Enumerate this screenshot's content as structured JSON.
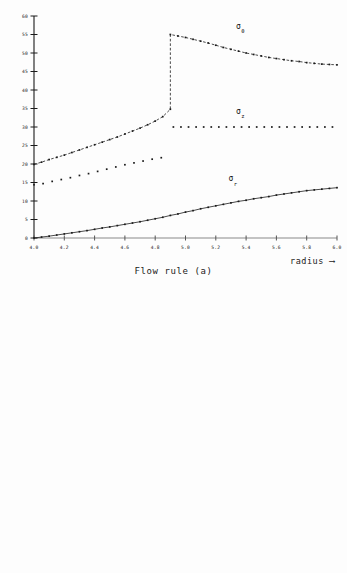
{
  "figures": [
    {
      "id": "flow-rule-a",
      "caption": "Flow rule (a)",
      "xaxis_label": "radius ⟶",
      "chart_data": {
        "type": "scatter",
        "title": "Flow rule (a)",
        "xlabel": "radius ⟶",
        "ylabel": "",
        "xlim": [
          4.0,
          6.0
        ],
        "ylim": [
          0,
          60
        ],
        "xticks": [
          4.0,
          4.2,
          4.4,
          4.6,
          4.8,
          5.0,
          5.2,
          5.4,
          5.6,
          5.8,
          6.0
        ],
        "xtick_labels": [
          "4.0",
          "4.2",
          "4.4",
          "4.6",
          "4.8",
          "5.0",
          "5.2",
          "5.4",
          "5.6",
          "5.8",
          "6.0"
        ],
        "yticks": [
          0,
          5,
          10,
          15,
          20,
          25,
          30,
          35,
          40,
          45,
          50,
          55,
          60
        ],
        "ytick_labels": [
          "0",
          "5",
          "10",
          "15",
          "20",
          "25",
          "30",
          "35",
          "40",
          "45",
          "50",
          "55",
          "60"
        ],
        "grid": false,
        "legend": "inline-annotations",
        "discontinuity_x": 4.9,
        "series": [
          {
            "name": "sigma_theta",
            "label_base": "σ",
            "label_sub": "θ",
            "label_x": 5.35,
            "label_y": 56.5,
            "style": "dashed-with-markers",
            "x": [
              4.0,
              4.05,
              4.1,
              4.15,
              4.2,
              4.25,
              4.3,
              4.35,
              4.4,
              4.45,
              4.5,
              4.55,
              4.6,
              4.65,
              4.7,
              4.75,
              4.8,
              4.85,
              4.9,
              4.9,
              4.95,
              5.0,
              5.05,
              5.1,
              5.15,
              5.2,
              5.25,
              5.3,
              5.35,
              5.4,
              5.45,
              5.5,
              5.55,
              5.6,
              5.65,
              5.7,
              5.75,
              5.8,
              5.85,
              5.9,
              5.95,
              6.0
            ],
            "y": [
              19.9,
              20.5,
              21.2,
              21.8,
              22.4,
              23.1,
              23.8,
              24.5,
              25.2,
              25.9,
              26.6,
              27.3,
              28.1,
              28.9,
              29.7,
              30.6,
              31.6,
              32.8,
              34.8,
              55.0,
              54.6,
              54.2,
              53.7,
              53.2,
              52.7,
              52.1,
              51.5,
              51.0,
              50.5,
              50.0,
              49.6,
              49.2,
              48.8,
              48.5,
              48.2,
              47.9,
              47.7,
              47.4,
              47.2,
              47.0,
              46.9,
              46.8
            ]
          },
          {
            "name": "sigma_z",
            "label_base": "σ",
            "label_sub": "z",
            "label_x": 5.35,
            "label_y": 33.6,
            "style": "dotted-markers",
            "x": [
              4.92,
              4.97,
              5.02,
              5.07,
              5.12,
              5.17,
              5.22,
              5.27,
              5.32,
              5.37,
              5.42,
              5.47,
              5.52,
              5.57,
              5.62,
              5.67,
              5.72,
              5.77,
              5.82,
              5.87,
              5.92,
              5.97
            ],
            "y": [
              30.0,
              30.0,
              30.0,
              30.0,
              30.0,
              30.0,
              30.0,
              30.0,
              30.0,
              30.0,
              30.0,
              30.0,
              30.0,
              30.0,
              30.0,
              30.0,
              30.0,
              30.0,
              30.0,
              30.0,
              30.0,
              30.0
            ]
          },
          {
            "name": "sigma_z_inner",
            "label_base": "",
            "label_sub": "",
            "style": "dotted-markers",
            "x": [
              4.0,
              4.06,
              4.12,
              4.18,
              4.24,
              4.3,
              4.36,
              4.42,
              4.48,
              4.54,
              4.6,
              4.66,
              4.72,
              4.78,
              4.84
            ],
            "y": [
              14.4,
              14.7,
              15.3,
              15.8,
              16.3,
              16.9,
              17.4,
              18.0,
              18.6,
              19.2,
              19.8,
              20.3,
              20.8,
              21.3,
              21.7
            ]
          },
          {
            "name": "sigma_r",
            "label_base": "σ",
            "label_sub": "r",
            "label_x": 5.3,
            "label_y": 15.3,
            "style": "solid-with-markers",
            "x": [
              4.0,
              4.05,
              4.1,
              4.15,
              4.2,
              4.25,
              4.3,
              4.35,
              4.4,
              4.45,
              4.5,
              4.55,
              4.6,
              4.65,
              4.7,
              4.75,
              4.8,
              4.85,
              4.9,
              4.95,
              5.0,
              5.05,
              5.1,
              5.15,
              5.2,
              5.25,
              5.3,
              5.35,
              5.4,
              5.45,
              5.5,
              5.55,
              5.6,
              5.65,
              5.7,
              5.75,
              5.8,
              5.85,
              5.9,
              5.95,
              6.0
            ],
            "y": [
              0.0,
              0.25,
              0.5,
              0.8,
              1.1,
              1.4,
              1.7,
              2.0,
              2.35,
              2.7,
              3.0,
              3.35,
              3.7,
              4.05,
              4.4,
              4.8,
              5.2,
              5.6,
              6.1,
              6.5,
              7.0,
              7.4,
              7.9,
              8.3,
              8.7,
              9.1,
              9.5,
              9.9,
              10.2,
              10.6,
              10.9,
              11.2,
              11.6,
              11.9,
              12.2,
              12.5,
              12.8,
              13.0,
              13.2,
              13.4,
              13.6
            ]
          }
        ]
      }
    },
    {
      "id": "flow-rule-b",
      "caption": "Flow rule (b)",
      "xaxis_label": "radius ⟶",
      "chart_data": {
        "type": "scatter",
        "title": "Flow rule (b)",
        "xlabel": "radius ⟶",
        "ylabel": "",
        "xlim": [
          4.0,
          6.0
        ],
        "ylim": [
          0,
          60
        ],
        "xticks": [
          4.0,
          4.2,
          4.4,
          4.6,
          4.8,
          5.0,
          5.2,
          5.4,
          5.6,
          5.8,
          6.0
        ],
        "xtick_labels": [
          "4.0",
          "4.2",
          "4.4",
          "4.6",
          "4.8",
          "5.0",
          "5.2",
          "5.4",
          "5.6",
          "5.8",
          "6.0"
        ],
        "yticks": [
          0,
          5,
          10,
          15,
          20,
          25,
          30,
          35,
          40,
          45,
          50,
          55,
          60
        ],
        "ytick_labels": [
          "0",
          "5",
          "10",
          "15",
          "20",
          "25",
          "30",
          "35",
          "40",
          "45",
          "50",
          "55",
          "60"
        ],
        "grid": false,
        "legend": "inline-annotations",
        "discontinuity_x": 4.9,
        "series": [
          {
            "name": "sigma_theta",
            "label_base": "σ",
            "label_sub": "θ",
            "label_x": 5.35,
            "label_y": 56.5,
            "style": "dashed-with-markers",
            "x": [
              4.0,
              4.05,
              4.1,
              4.15,
              4.2,
              4.25,
              4.3,
              4.35,
              4.4,
              4.45,
              4.5,
              4.55,
              4.6,
              4.65,
              4.7,
              4.75,
              4.8,
              4.85,
              4.9,
              4.9,
              4.95,
              5.0,
              5.05,
              5.1,
              5.15,
              5.2,
              5.25,
              5.3,
              5.35,
              5.4,
              5.45,
              5.5,
              5.55,
              5.6,
              5.65,
              5.7,
              5.75,
              5.8,
              5.85,
              5.9,
              5.95,
              6.0
            ],
            "y": [
              19.9,
              20.5,
              21.2,
              21.9,
              22.6,
              23.3,
              24.0,
              24.7,
              25.4,
              26.1,
              26.8,
              27.5,
              28.3,
              29.1,
              29.9,
              30.8,
              31.8,
              33.0,
              34.9,
              55.0,
              54.5,
              54.0,
              53.5,
              53.0,
              52.5,
              52.0,
              51.4,
              50.9,
              50.4,
              49.9,
              49.5,
              49.1,
              48.7,
              48.4,
              48.1,
              47.8,
              47.5,
              47.3,
              47.1,
              46.9,
              46.8,
              46.7
            ]
          },
          {
            "name": "sigma_z",
            "label_base": "σ",
            "label_sub": "z",
            "label_x": 5.35,
            "label_y": 33.6,
            "style": "dotted-markers",
            "x": [
              4.92,
              4.97,
              5.02,
              5.07,
              5.12,
              5.17,
              5.22,
              5.27,
              5.32,
              5.37,
              5.42,
              5.47,
              5.52,
              5.57,
              5.62,
              5.67,
              5.72,
              5.77,
              5.82,
              5.87,
              5.92,
              5.97
            ],
            "y": [
              30.0,
              30.0,
              30.0,
              30.0,
              30.0,
              30.0,
              30.0,
              30.0,
              30.0,
              30.0,
              30.0,
              30.0,
              30.0,
              30.0,
              30.0,
              30.0,
              30.0,
              30.0,
              30.0,
              30.0,
              30.0,
              30.0
            ]
          },
          {
            "name": "sigma_z_inner",
            "label_base": "",
            "label_sub": "",
            "style": "dotted-markers",
            "x": [
              4.0,
              4.06,
              4.12,
              4.18,
              4.24,
              4.3,
              4.36,
              4.42,
              4.48,
              4.54,
              4.6,
              4.66,
              4.72,
              4.78,
              4.84
            ],
            "y": [
              11.8,
              12.3,
              13.0,
              13.6,
              14.2,
              14.9,
              15.5,
              16.2,
              16.9,
              17.6,
              18.3,
              19.0,
              19.6,
              20.3,
              21.0
            ]
          },
          {
            "name": "sigma_r",
            "label_base": "σ",
            "label_sub": "r",
            "label_x": 5.3,
            "label_y": 15.3,
            "style": "solid-with-markers",
            "x": [
              4.0,
              4.05,
              4.1,
              4.15,
              4.2,
              4.25,
              4.3,
              4.35,
              4.4,
              4.45,
              4.5,
              4.55,
              4.6,
              4.65,
              4.7,
              4.75,
              4.8,
              4.85,
              4.9,
              4.95,
              5.0,
              5.05,
              5.1,
              5.15,
              5.2,
              5.25,
              5.3,
              5.35,
              5.4,
              5.45,
              5.5,
              5.55,
              5.6,
              5.65,
              5.7,
              5.75,
              5.8,
              5.85,
              5.9,
              5.95,
              6.0
            ],
            "y": [
              0.0,
              0.25,
              0.5,
              0.8,
              1.1,
              1.4,
              1.7,
              2.0,
              2.35,
              2.7,
              3.0,
              3.35,
              3.7,
              4.05,
              4.4,
              4.8,
              5.2,
              5.6,
              6.0,
              6.4,
              6.9,
              7.3,
              7.7,
              8.1,
              8.5,
              8.9,
              9.3,
              9.7,
              10.1,
              10.4,
              10.8,
              11.1,
              11.4,
              11.7,
              12.0,
              12.3,
              12.6,
              12.9,
              13.1,
              13.3,
              13.5
            ]
          }
        ]
      }
    }
  ]
}
